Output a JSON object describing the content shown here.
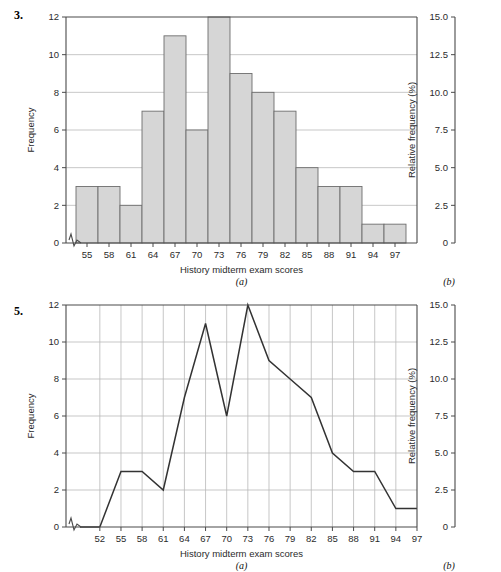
{
  "page": {
    "background": "#ffffff",
    "bar_fill": "#d6d6d6",
    "bar_stroke": "#6e6e6e",
    "grid_color": "#b9b9b9",
    "axis_color": "#4a4a4a",
    "line_color": "#333333"
  },
  "figures": [
    {
      "number": "3.",
      "panel_a_label": "(a)",
      "panel_b_label": "(b)",
      "chart_data": {
        "type": "bar",
        "title": "",
        "xlabel": "History midterm exam scores",
        "ylabel": "Frequency",
        "y2label": "Relative frequency (%)",
        "categories": [
          55,
          58,
          61,
          64,
          67,
          70,
          73,
          76,
          79,
          82,
          85,
          88,
          91,
          94,
          97
        ],
        "values": [
          3,
          3,
          2,
          7,
          11,
          6,
          12,
          9,
          8,
          7,
          4,
          3,
          3,
          1,
          1
        ],
        "xtick_labels": [
          "55",
          "58",
          "61",
          "64",
          "67",
          "70",
          "73",
          "76",
          "79",
          "82",
          "85",
          "88",
          "91",
          "94",
          "97"
        ],
        "ytick_labels": [
          "0",
          "2",
          "4",
          "6",
          "8",
          "10",
          "12"
        ],
        "ytick_values": [
          0,
          2,
          4,
          6,
          8,
          10,
          12
        ],
        "ylim": [
          0,
          12
        ],
        "y2tick_labels": [
          "0",
          "2.5",
          "5.0",
          "7.5",
          "10.0",
          "12.5",
          "15.0"
        ],
        "y2tick_values": [
          0,
          2.5,
          5.0,
          7.5,
          10.0,
          12.5,
          15.0
        ],
        "y2lim": [
          0,
          15
        ],
        "grid": "horizontal",
        "axis_break": true,
        "legend": "none"
      }
    },
    {
      "number": "5.",
      "panel_a_label": "(a)",
      "panel_b_label": "(b)",
      "chart_data": {
        "type": "line",
        "title": "",
        "xlabel": "History midterm exam scores",
        "ylabel": "Frequency",
        "y2label": "Relative frequency (%)",
        "x": [
          52,
          55,
          58,
          61,
          64,
          67,
          70,
          73,
          76,
          79,
          82,
          85,
          88,
          91,
          94,
          97
        ],
        "values": [
          0,
          3,
          3,
          2,
          7,
          11,
          6,
          12,
          9,
          8,
          7,
          4,
          3,
          3,
          1,
          1
        ],
        "xtick_labels": [
          "52",
          "55",
          "58",
          "61",
          "64",
          "67",
          "70",
          "73",
          "76",
          "79",
          "82",
          "85",
          "88",
          "91",
          "94",
          "97"
        ],
        "ytick_labels": [
          "0",
          "2",
          "4",
          "6",
          "8",
          "10",
          "12"
        ],
        "ytick_values": [
          0,
          2,
          4,
          6,
          8,
          10,
          12
        ],
        "ylim": [
          0,
          12
        ],
        "y2tick_labels": [
          "0",
          "2.5",
          "5.0",
          "7.5",
          "10.0",
          "12.5",
          "15.0"
        ],
        "y2tick_values": [
          0,
          2.5,
          5.0,
          7.5,
          10.0,
          12.5,
          15.0
        ],
        "y2lim": [
          0,
          15
        ],
        "grid": "both",
        "axis_break": true,
        "legend": "none"
      }
    }
  ]
}
